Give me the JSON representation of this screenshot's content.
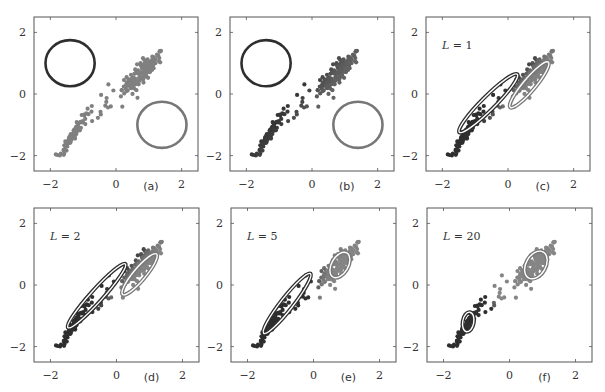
{
  "figure": {
    "width": 605,
    "height": 392,
    "colors": {
      "frame": "#555555",
      "dark": "#2e2e2e",
      "light": "#777777",
      "points_uncolored": "#808080"
    }
  },
  "chart_data": [
    {
      "type": "scatter",
      "panel": "(a)",
      "title": "",
      "annotation": "",
      "xlim": [
        -2.5,
        2.5
      ],
      "ylim": [
        -2.5,
        2.5
      ],
      "xticks": [
        -2,
        0,
        2
      ],
      "yticks": [
        -2,
        0,
        2
      ],
      "point_coloring": "uncolored",
      "components": [
        {
          "name": "component-1",
          "color": "dark",
          "mean": [
            -1.4,
            1.0
          ],
          "cov_shape": "circle",
          "radius": 0.75
        },
        {
          "name": "component-2",
          "color": "light",
          "mean": [
            1.4,
            -1.0
          ],
          "cov_shape": "circle",
          "radius": 0.75
        }
      ]
    },
    {
      "type": "scatter",
      "panel": "(b)",
      "annotation": "",
      "xlim": [
        -2.5,
        2.5
      ],
      "ylim": [
        -2.5,
        2.5
      ],
      "xticks": [
        -2,
        0,
        2
      ],
      "yticks": [
        -2,
        0,
        2
      ],
      "point_coloring": "responsibility",
      "components": [
        {
          "name": "component-1",
          "color": "dark",
          "mean": [
            -1.4,
            1.0
          ],
          "cov_shape": "circle",
          "radius": 0.75
        },
        {
          "name": "component-2",
          "color": "light",
          "mean": [
            1.4,
            -1.0
          ],
          "cov_shape": "circle",
          "radius": 0.75
        }
      ]
    },
    {
      "type": "scatter",
      "panel": "(c)",
      "annotation": "L = 1",
      "xlim": [
        -2.5,
        2.5
      ],
      "ylim": [
        -2.5,
        2.5
      ],
      "xticks": [
        -2,
        0,
        2
      ],
      "yticks": [
        -2,
        0,
        2
      ],
      "point_coloring": "responsibility",
      "components": [
        {
          "name": "component-1",
          "color": "dark",
          "mean": [
            -0.6,
            -0.3
          ],
          "rx": 1.25,
          "ry": 0.22,
          "angle_deg": 45
        },
        {
          "name": "component-2",
          "color": "light",
          "mean": [
            0.65,
            0.3
          ],
          "rx": 0.9,
          "ry": 0.2,
          "angle_deg": 50
        }
      ]
    },
    {
      "type": "scatter",
      "panel": "(d)",
      "annotation": "L = 2",
      "xlim": [
        -2.5,
        2.5
      ],
      "ylim": [
        -2.5,
        2.5
      ],
      "xticks": [
        -2,
        0,
        2
      ],
      "yticks": [
        -2,
        0,
        2
      ],
      "point_coloring": "responsibility",
      "components": [
        {
          "name": "component-1",
          "color": "dark",
          "mean": [
            -0.6,
            -0.35
          ],
          "rx": 1.3,
          "ry": 0.2,
          "angle_deg": 48
        },
        {
          "name": "component-2",
          "color": "light",
          "mean": [
            0.7,
            0.35
          ],
          "rx": 0.8,
          "ry": 0.2,
          "angle_deg": 50
        }
      ]
    },
    {
      "type": "scatter",
      "panel": "(e)",
      "annotation": "L = 5",
      "xlim": [
        -2.5,
        2.5
      ],
      "ylim": [
        -2.5,
        2.5
      ],
      "xticks": [
        -2,
        0,
        2
      ],
      "yticks": [
        -2,
        0,
        2
      ],
      "point_coloring": "responsibility",
      "components": [
        {
          "name": "component-1",
          "color": "dark",
          "mean": [
            -0.8,
            -0.6
          ],
          "rx": 1.15,
          "ry": 0.2,
          "angle_deg": 52
        },
        {
          "name": "component-2",
          "color": "light",
          "mean": [
            0.8,
            0.65
          ],
          "rx": 0.42,
          "ry": 0.27,
          "angle_deg": 60
        }
      ]
    },
    {
      "type": "scatter",
      "panel": "(f)",
      "annotation": "L = 20",
      "xlim": [
        -2.5,
        2.5
      ],
      "ylim": [
        -2.5,
        2.5
      ],
      "xticks": [
        -2,
        0,
        2
      ],
      "yticks": [
        -2,
        0,
        2
      ],
      "point_coloring": "responsibility",
      "components": [
        {
          "name": "component-1",
          "color": "dark",
          "mean": [
            -1.25,
            -1.2
          ],
          "rx": 0.3,
          "ry": 0.18,
          "angle_deg": 80
        },
        {
          "name": "component-2",
          "color": "light",
          "mean": [
            0.8,
            0.65
          ],
          "rx": 0.45,
          "ry": 0.32,
          "angle_deg": 60
        }
      ]
    }
  ],
  "data_clusters": {
    "upper_right": {
      "center": [
        0.8,
        0.7
      ],
      "spread": [
        0.3,
        0.3
      ],
      "count": 150
    },
    "lower_left": {
      "center": [
        -1.3,
        -1.3
      ],
      "spread": [
        0.2,
        0.3
      ],
      "count": 95
    },
    "bridge": {
      "count": 20
    }
  },
  "panels_layout": [
    {
      "left": 34,
      "top": 17,
      "width": 164,
      "height": 154
    },
    {
      "left": 230,
      "top": 17,
      "width": 164,
      "height": 154
    },
    {
      "left": 426,
      "top": 17,
      "width": 164,
      "height": 154
    },
    {
      "left": 34,
      "top": 208,
      "width": 165,
      "height": 154
    },
    {
      "left": 231,
      "top": 208,
      "width": 165,
      "height": 154
    },
    {
      "left": 427,
      "top": 208,
      "width": 165,
      "height": 154
    }
  ]
}
